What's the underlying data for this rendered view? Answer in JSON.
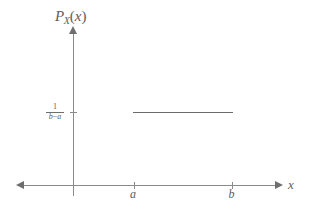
{
  "figure": {
    "background_color": "#ffffff",
    "axis_color": "#8a8a8a",
    "curve_color": "#6b6b6b",
    "text_color": "#5d5d5d"
  },
  "axes": {
    "y_label_main": "P",
    "y_label_sub": "X",
    "y_label_paren_open": "(",
    "y_label_arg": "x",
    "y_label_paren_close": ")",
    "y_label_full": "P_X(x)",
    "x_label": "x"
  },
  "ticks": {
    "x": [
      {
        "name": "a",
        "label": "a",
        "pixel_x": 134
      },
      {
        "name": "b",
        "label": "b",
        "pixel_x": 232
      }
    ],
    "y": [
      {
        "name": "density",
        "numerator": "1",
        "operator": "−",
        "denominator_left": "b",
        "denominator_right": "a",
        "label_full": "1/(b−a)",
        "pixel_y": 112
      }
    ]
  },
  "chart_data": {
    "type": "line",
    "title": "",
    "subtitle": "",
    "xlabel": "x",
    "ylabel": "P_X(x)",
    "grid": false,
    "legend": null,
    "xticks": [
      "a",
      "b"
    ],
    "yticks": [
      "1/(b-a)"
    ],
    "xlim": [
      "-inf",
      "+inf"
    ],
    "ylim": [
      0,
      null
    ],
    "series": [
      {
        "name": "uniform-pdf",
        "x": [
          "a",
          "b"
        ],
        "y": [
          "1/(b-a)",
          "1/(b-a)"
        ],
        "style": "solid",
        "color": "#6b6b6b"
      }
    ],
    "annotations": []
  }
}
